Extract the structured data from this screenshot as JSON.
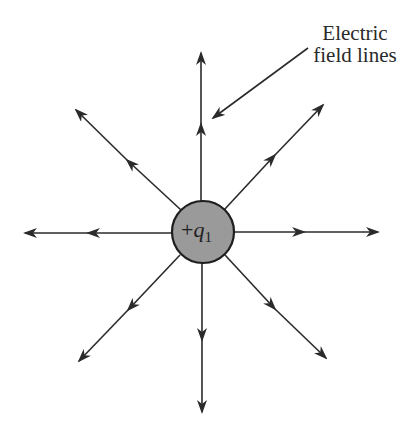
{
  "figure": {
    "label_line1": "Electric",
    "label_line2": "field lines",
    "charge_sign": "+",
    "charge_symbol": "q",
    "charge_subscript": "1",
    "colors": {
      "line": "#2b2b2b",
      "charge_fill": "#9a9a9a",
      "background": "#ffffff"
    }
  }
}
